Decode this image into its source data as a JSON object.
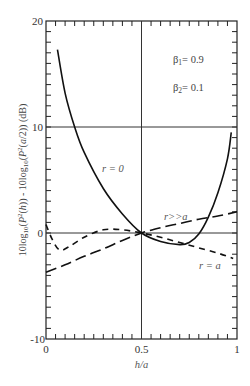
{
  "chart_data": {
    "type": "line",
    "title": "",
    "xlabel": "h/a",
    "ylabel": "10log10(P²(h)) - 10log10(P²(a/2)) (dB)",
    "xlim": [
      0,
      1
    ],
    "ylim": [
      -10,
      20
    ],
    "x_ticks": [
      "0",
      "0.5",
      "1"
    ],
    "y_ticks": [
      "-10",
      "0",
      "10",
      "20"
    ],
    "grid": "reference lines at y=0, y=10 and x=0.5",
    "legend": null,
    "annotations": [
      "β1= 0.9",
      "β2= 0.1",
      "r = 0",
      "r>>a",
      "r = a"
    ],
    "series": [
      {
        "name": "r = 0",
        "style": "solid",
        "x": [
          0.06,
          0.1,
          0.15,
          0.2,
          0.3,
          0.4,
          0.5,
          0.6,
          0.7,
          0.75,
          0.8,
          0.85,
          0.9,
          0.95,
          0.97
        ],
        "y": [
          17.3,
          13.2,
          10.0,
          7.6,
          4.2,
          1.8,
          0.0,
          -0.8,
          -1.1,
          -0.9,
          -0.1,
          1.5,
          3.8,
          7.0,
          9.5
        ]
      },
      {
        "name": "r>>a",
        "style": "long-dash",
        "x": [
          0.0,
          0.1,
          0.2,
          0.3,
          0.4,
          0.5,
          0.6,
          0.7,
          0.8,
          0.9,
          1.0
        ],
        "y": [
          -3.7,
          -3.0,
          -2.2,
          -1.5,
          -0.7,
          0.0,
          0.5,
          0.9,
          1.3,
          1.6,
          2.0
        ]
      },
      {
        "name": "r = a",
        "style": "short-dash",
        "x": [
          0.0,
          0.03,
          0.07,
          0.12,
          0.2,
          0.3,
          0.4,
          0.5,
          0.6,
          0.7,
          0.8,
          0.9,
          0.98
        ],
        "y": [
          0.8,
          -0.5,
          -1.6,
          -1.3,
          -0.4,
          0.3,
          0.3,
          0.0,
          -0.4,
          -0.9,
          -1.4,
          -1.9,
          -2.4
        ]
      }
    ]
  },
  "labels": {
    "beta1": "β1= 0.9",
    "beta2": "β2= 0.1",
    "curve_r0": "r = 0",
    "curve_rgg": "r>>a",
    "curve_ra": "r = a",
    "xlabel": "h/a",
    "ylabel": "10log10(P²(h)) - 10log10(P²(a/2))  (dB)",
    "xtick_0": "0",
    "xtick_05": "0.5",
    "xtick_1": "1",
    "ytick_20": "20",
    "ytick_10": "10",
    "ytick_0": "0",
    "ytick_m10": "-10"
  }
}
